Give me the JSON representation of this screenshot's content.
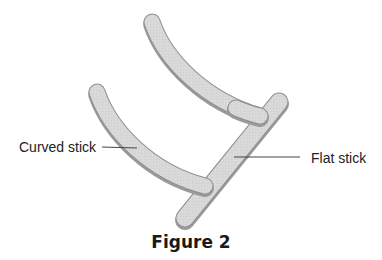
{
  "figure": {
    "caption": "Figure 2",
    "labels": {
      "curved_stick": "Curved stick",
      "flat_stick": "Flat stick"
    },
    "colors": {
      "stick_fill": "#d6d6d6",
      "stick_edge": "#8f8f8f",
      "stick_shadow": "#a8a8a8",
      "leader_line": "#444444",
      "text": "#222222"
    }
  }
}
